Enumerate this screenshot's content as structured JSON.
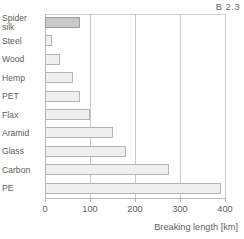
{
  "corner_code": "B 2.3",
  "chart_data": {
    "type": "bar",
    "orientation": "horizontal",
    "title": "",
    "xlabel": "Breaking length [km]",
    "ylabel": "",
    "xlim": [
      0,
      400
    ],
    "xticks": [
      0,
      100,
      200,
      300,
      400
    ],
    "xtick_labels": [
      "0",
      "100",
      "200",
      "300",
      "400"
    ],
    "grid": true,
    "grid_axis": "x",
    "legend": false,
    "categories": [
      "Spider\nsilk",
      "Steel",
      "Wood",
      "Hemp",
      "PET",
      "Flax",
      "Aramid",
      "Glass",
      "Carbon",
      "PE"
    ],
    "values": [
      78,
      15,
      33,
      62,
      78,
      100,
      150,
      180,
      275,
      390
    ],
    "bars": [
      {
        "label": "Spider\nsilk",
        "value": 78,
        "highlight": true
      },
      {
        "label": "Steel",
        "value": 15,
        "highlight": false
      },
      {
        "label": "Wood",
        "value": 33,
        "highlight": false
      },
      {
        "label": "Hemp",
        "value": 62,
        "highlight": false
      },
      {
        "label": "PET",
        "value": 78,
        "highlight": false
      },
      {
        "label": "Flax",
        "value": 100,
        "highlight": false
      },
      {
        "label": "Aramid",
        "value": 150,
        "highlight": false
      },
      {
        "label": "Glass",
        "value": 180,
        "highlight": false
      },
      {
        "label": "Carbon",
        "value": 275,
        "highlight": false
      },
      {
        "label": "PE",
        "value": 390,
        "highlight": false
      }
    ],
    "colors": {
      "bar_fill": "#efefef",
      "bar_edge": "#b4b4b4",
      "highlight_fill": "#c9c9c9",
      "highlight_edge": "#9e9e9e",
      "grid": "#c9c9c9",
      "axis": "#b9b9b9",
      "text": "#5e5e5e"
    }
  }
}
